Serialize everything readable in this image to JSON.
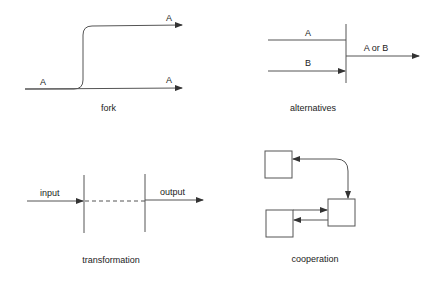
{
  "diagrams": {
    "fork": {
      "caption": "fork",
      "input_label": "A",
      "output_top_label": "A",
      "output_bottom_label": "A"
    },
    "alternatives": {
      "caption": "alternatives",
      "input_a_label": "A",
      "input_b_label": "B",
      "output_label": "A or B"
    },
    "transformation": {
      "caption": "transformation",
      "input_label": "input",
      "output_label": "output"
    },
    "cooperation": {
      "caption": "cooperation"
    }
  },
  "colors": {
    "line": "#555555",
    "text": "#222222",
    "background": "#ffffff"
  }
}
